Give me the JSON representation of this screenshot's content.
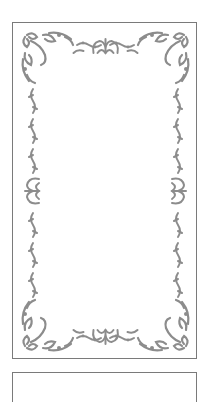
{
  "canvas": {
    "width": 208,
    "height": 383,
    "background": "#ffffff"
  },
  "frames": [
    {
      "id": "frame-1",
      "style": "ornamental-border",
      "stroke": "#7a7a7a",
      "ornament_color": "#8c8c8c"
    },
    {
      "id": "frame-2",
      "style": "plain-border-partial",
      "stroke": "#7a7a7a"
    }
  ],
  "ornaments": {
    "corners": [
      "top-left",
      "top-right",
      "bottom-left",
      "bottom-right"
    ],
    "center_motifs": [
      "top",
      "bottom",
      "left",
      "right"
    ],
    "color": "#8c8c8c"
  }
}
